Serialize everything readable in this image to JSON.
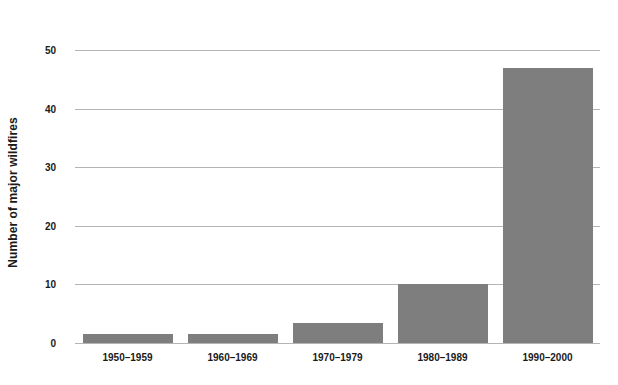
{
  "chart_data": {
    "type": "bar",
    "title": "",
    "subtitle": "",
    "xlabel": "",
    "ylabel": "Number of major wildfires",
    "categories": [
      "1950–1959",
      "1960–1969",
      "1970–1979",
      "1980–1989",
      "1990–2000"
    ],
    "values": [
      1.6,
      1.6,
      3.5,
      10,
      47
    ],
    "ylim": [
      0,
      50
    ],
    "ytick_labels": [
      "0",
      "10",
      "20",
      "30",
      "40",
      "50"
    ],
    "ytick_values": [
      0,
      10,
      20,
      30,
      40,
      50
    ],
    "grid": true,
    "legend": "none",
    "bar_color": "#7e7e7e",
    "gridline_color": "#b4b4b4",
    "background_color": "#ffffff",
    "text_color": "#1a1a1a"
  }
}
